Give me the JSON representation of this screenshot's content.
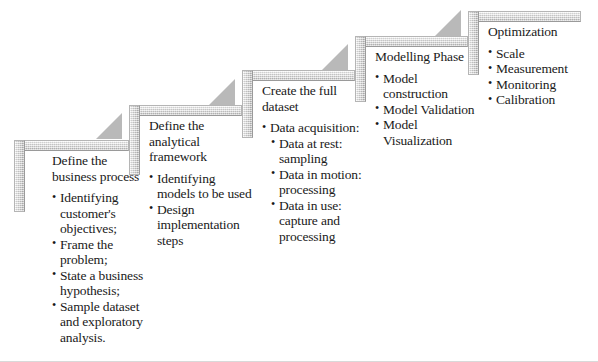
{
  "diagram": {
    "type": "staircase-process-flow",
    "background_color": "#ffffff",
    "bar_color": "#cfcfcf",
    "arrow_color": "#b9b9b9",
    "text_color": "#1a1a1a",
    "stage_count": 5
  },
  "stages": [
    {
      "index": 1,
      "title": "Define the business process",
      "bullets": [
        {
          "text": "Identifying customer's objectives;",
          "level": 1
        },
        {
          "text": "Frame the problem;",
          "level": 1
        },
        {
          "text": "State a business hypothesis;",
          "level": 1
        },
        {
          "text": "Sample dataset and exploratory analysis.",
          "level": 1
        }
      ]
    },
    {
      "index": 2,
      "title": "Define the analytical framework",
      "bullets": [
        {
          "text": "Identifying models to be used",
          "level": 1
        },
        {
          "text": "Design implementation steps",
          "level": 1
        }
      ]
    },
    {
      "index": 3,
      "title": "Create the full dataset",
      "bullets": [
        {
          "text": "Data acquisition:",
          "level": 1
        },
        {
          "text": "Data at rest: sampling",
          "level": 2
        },
        {
          "text": "Data in motion: processing",
          "level": 2
        },
        {
          "text": "Data in use: capture and processing",
          "level": 2
        }
      ]
    },
    {
      "index": 4,
      "title": "Modelling Phase",
      "bullets": [
        {
          "text": "Model construction",
          "level": 1
        },
        {
          "text": "Model Validation",
          "level": 1
        },
        {
          "text": "Model Visualization",
          "level": 1
        }
      ]
    },
    {
      "index": 5,
      "title": "Optimization",
      "bullets": [
        {
          "text": "Scale",
          "level": 1
        },
        {
          "text": "Measurement",
          "level": 1
        },
        {
          "text": "Monitoring",
          "level": 1
        },
        {
          "text": "Calibration",
          "level": 1
        }
      ]
    }
  ]
}
